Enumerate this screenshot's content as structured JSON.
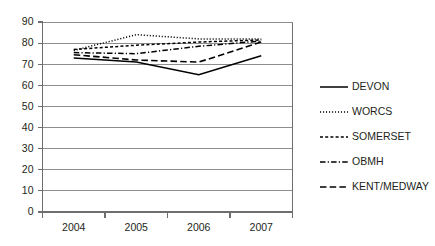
{
  "chart_data": {
    "type": "line",
    "title": "",
    "subtitle": "",
    "xlabel": "",
    "ylabel": "",
    "categories": [
      "2004",
      "2005",
      "2006",
      "2007"
    ],
    "ylim": [
      0,
      90
    ],
    "yticks": [
      0,
      10,
      20,
      30,
      40,
      50,
      60,
      70,
      80,
      90
    ],
    "ytick_labels": [
      "0",
      "10",
      "20",
      "30",
      "40",
      "50",
      "60",
      "70",
      "80",
      "90"
    ],
    "grid": true,
    "grid_axis": "y",
    "legend_position": "right",
    "series": [
      {
        "name": "DEVON",
        "style": "solid",
        "color": "#000000",
        "values": [
          73,
          71,
          65,
          74
        ]
      },
      {
        "name": "WORCS",
        "style": "dotted",
        "color": "#000000",
        "values": [
          76.5,
          84,
          82,
          82
        ]
      },
      {
        "name": "SOMERSET",
        "style": "dashed",
        "color": "#000000",
        "values": [
          77,
          79,
          80.5,
          81.5
        ]
      },
      {
        "name": "OBMH",
        "style": "dash-dot",
        "color": "#000000",
        "values": [
          75.5,
          75,
          78.5,
          81
        ]
      },
      {
        "name": "KENT/MEDWAY",
        "style": "long-dashed",
        "color": "#000000",
        "values": [
          74.5,
          72,
          71,
          80.5
        ]
      }
    ]
  },
  "legend": {
    "items": [
      {
        "label": "DEVON"
      },
      {
        "label": "WORCS"
      },
      {
        "label": "SOMERSET"
      },
      {
        "label": "OBMH"
      },
      {
        "label": "KENT/MEDWAY"
      }
    ]
  },
  "colors": {
    "line": "#000000",
    "grid": "#8d8d8d",
    "axis": "#6e6e6e",
    "text": "#231f20",
    "background": "#ffffff"
  }
}
